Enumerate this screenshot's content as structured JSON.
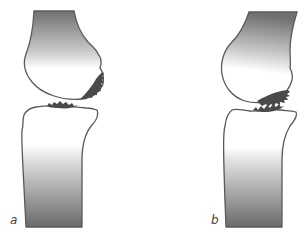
{
  "figure": {
    "panels": [
      {
        "id": "a",
        "label": "a"
      },
      {
        "id": "b",
        "label": "b"
      }
    ]
  },
  "colors": {
    "outline": "#5a5a5a",
    "bone_dark": "#6b6b6b",
    "bone_light": "#ffffff",
    "cartilage_lesion": "#4a4a4a",
    "background": "#ffffff"
  }
}
